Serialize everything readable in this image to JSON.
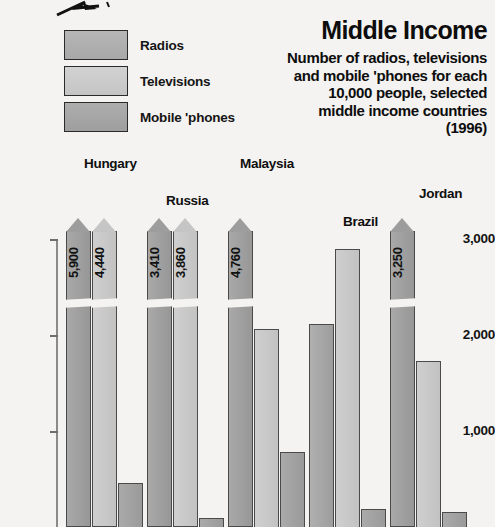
{
  "title": {
    "main": "Middle Income",
    "subtitle_lines": [
      "Number of radios, televisions",
      "and mobile 'phones for each",
      "10,000 people, selected",
      "middle income countries"
    ],
    "year": "(1996)"
  },
  "legend": {
    "items": [
      {
        "label": "Radios",
        "key": "radios",
        "color": "#a8a8a8"
      },
      {
        "label": "Televisions",
        "key": "tv",
        "color": "#c4c4c4"
      },
      {
        "label": "Mobile 'phones",
        "key": "mobile",
        "color": "#9e9e9e"
      }
    ]
  },
  "axis": {
    "ticks": [
      "3,000",
      "2,000",
      "1,000"
    ]
  },
  "chart_data": {
    "type": "bar",
    "title": "Middle Income",
    "subtitle": "Number of radios, televisions and mobile 'phones for each 10,000 people, selected middle income countries (1996)",
    "xlabel": "",
    "ylabel": "",
    "ylim": [
      0,
      3000
    ],
    "yticks": [
      1000,
      2000,
      3000
    ],
    "ytick_labels": [
      "1,000",
      "2,000",
      "3,000"
    ],
    "grid": false,
    "legend_position": "top-left",
    "axis_note": "Radios bars exceed the 3,000 axis maximum and are drawn as broken arrow-topped bars with their values printed inside.",
    "categories": [
      "Hungary",
      "Russia",
      "Malaysia",
      "Brazil",
      "Jordan"
    ],
    "series": [
      {
        "name": "Radios",
        "color": "#a8a8a8",
        "values": [
          5900,
          3410,
          4760,
          2110,
          3250
        ],
        "labels": [
          "5,900",
          "3,410",
          "4,760",
          "",
          "3,250"
        ],
        "clipped": [
          true,
          true,
          true,
          false,
          true
        ]
      },
      {
        "name": "Televisions",
        "color": "#c4c4c4",
        "values": [
          4440,
          3860,
          2060,
          2900,
          1730
        ],
        "labels": [
          "4,440",
          "3,860",
          "",
          "",
          ""
        ],
        "clipped": [
          true,
          true,
          false,
          false,
          false
        ]
      },
      {
        "name": "Mobile 'phones",
        "color": "#9e9e9e",
        "values": [
          460,
          90,
          780,
          190,
          160
        ],
        "labels": [
          "",
          "",
          "",
          "",
          ""
        ],
        "clipped": [
          false,
          false,
          false,
          false,
          false
        ]
      }
    ]
  },
  "countries": [
    {
      "name": "Hungary",
      "label_x": 84,
      "label_y": 156,
      "group_x": 66
    },
    {
      "name": "Russia",
      "label_x": 166,
      "label_y": 193,
      "group_x": 147
    },
    {
      "name": "Malaysia",
      "label_x": 240,
      "label_y": 156,
      "group_x": 228
    },
    {
      "name": "Brazil",
      "label_x": 343,
      "label_y": 214,
      "group_x": 309
    },
    {
      "name": "Jordan",
      "label_x": 419,
      "label_y": 186,
      "group_x": 390
    }
  ]
}
